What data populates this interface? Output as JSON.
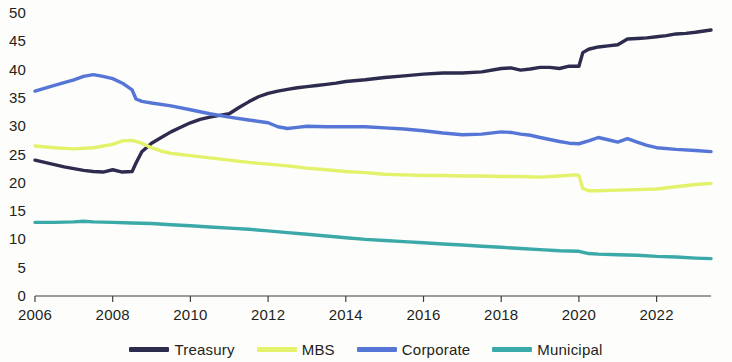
{
  "chart_data": {
    "type": "line",
    "title": "",
    "subtitle": "",
    "xlabel": "",
    "ylabel": "",
    "xlim": [
      2006,
      2023.4
    ],
    "ylim": [
      0,
      50
    ],
    "grid": false,
    "legend_position": "bottom",
    "x_tick_labels": [
      "2006",
      "2008",
      "2010",
      "2012",
      "2014",
      "2016",
      "2018",
      "2020",
      "2022"
    ],
    "x_ticks": [
      2006,
      2008,
      2010,
      2012,
      2014,
      2016,
      2018,
      2020,
      2022
    ],
    "y_tick_labels": [
      "0",
      "5",
      "10",
      "15",
      "20",
      "25",
      "30",
      "35",
      "40",
      "45",
      "50"
    ],
    "y_ticks": [
      0,
      5,
      10,
      15,
      20,
      25,
      30,
      35,
      40,
      45,
      50
    ],
    "series": [
      {
        "name": "Treasury",
        "color": "#2e2c4e",
        "x": [
          2006.0,
          2006.25,
          2006.5,
          2006.75,
          2007.0,
          2007.25,
          2007.5,
          2007.75,
          2008.0,
          2008.25,
          2008.5,
          2008.6,
          2008.75,
          2009.0,
          2009.25,
          2009.5,
          2009.75,
          2010.0,
          2010.25,
          2010.5,
          2010.75,
          2011.0,
          2011.25,
          2011.5,
          2011.75,
          2012.0,
          2012.25,
          2012.5,
          2012.75,
          2013.0,
          2013.25,
          2013.5,
          2013.75,
          2014.0,
          2014.5,
          2015.0,
          2015.5,
          2016.0,
          2016.5,
          2017.0,
          2017.5,
          2018.0,
          2018.25,
          2018.5,
          2018.75,
          2019.0,
          2019.25,
          2019.5,
          2019.75,
          2020.0,
          2020.1,
          2020.25,
          2020.5,
          2020.75,
          2021.0,
          2021.25,
          2021.5,
          2021.75,
          2022.0,
          2022.25,
          2022.5,
          2022.75,
          2023.0,
          2023.4
        ],
        "values": [
          24.0,
          23.6,
          23.2,
          22.8,
          22.5,
          22.2,
          22.0,
          21.9,
          22.3,
          21.9,
          22.0,
          23.5,
          25.5,
          27.0,
          28.0,
          29.0,
          29.8,
          30.6,
          31.2,
          31.6,
          31.9,
          32.2,
          33.3,
          34.3,
          35.2,
          35.8,
          36.2,
          36.5,
          36.8,
          37.0,
          37.2,
          37.4,
          37.6,
          37.9,
          38.2,
          38.6,
          38.9,
          39.2,
          39.4,
          39.4,
          39.6,
          40.2,
          40.3,
          39.9,
          40.1,
          40.4,
          40.4,
          40.2,
          40.6,
          40.6,
          43.0,
          43.6,
          44.0,
          44.2,
          44.4,
          45.4,
          45.5,
          45.6,
          45.8,
          46.0,
          46.3,
          46.4,
          46.6,
          47.0
        ]
      },
      {
        "name": "MBS",
        "color": "#e3f16b",
        "x": [
          2006.0,
          2006.5,
          2007.0,
          2007.5,
          2008.0,
          2008.25,
          2008.5,
          2008.75,
          2009.0,
          2009.25,
          2009.5,
          2009.75,
          2010.0,
          2010.5,
          2011.0,
          2011.5,
          2012.0,
          2012.5,
          2013.0,
          2013.5,
          2014.0,
          2014.5,
          2015.0,
          2015.5,
          2016.0,
          2016.5,
          2017.0,
          2017.5,
          2018.0,
          2018.5,
          2019.0,
          2019.5,
          2019.9,
          2020.0,
          2020.1,
          2020.25,
          2020.5,
          2021.0,
          2021.5,
          2022.0,
          2022.5,
          2023.0,
          2023.4
        ],
        "values": [
          26.5,
          26.2,
          26.0,
          26.2,
          26.8,
          27.4,
          27.5,
          27.0,
          26.2,
          25.6,
          25.2,
          25.0,
          24.8,
          24.4,
          24.0,
          23.6,
          23.3,
          23.0,
          22.6,
          22.3,
          22.0,
          21.8,
          21.5,
          21.4,
          21.3,
          21.3,
          21.2,
          21.2,
          21.1,
          21.1,
          21.0,
          21.2,
          21.4,
          21.3,
          19.0,
          18.6,
          18.6,
          18.7,
          18.8,
          18.9,
          19.3,
          19.7,
          19.9
        ]
      },
      {
        "name": "Corporate",
        "color": "#5576d6",
        "x": [
          2006.0,
          2006.5,
          2007.0,
          2007.25,
          2007.5,
          2007.75,
          2008.0,
          2008.25,
          2008.5,
          2008.6,
          2008.75,
          2009.0,
          2009.5,
          2010.0,
          2010.5,
          2011.0,
          2011.5,
          2012.0,
          2012.25,
          2012.5,
          2012.75,
          2013.0,
          2013.5,
          2014.0,
          2014.5,
          2015.0,
          2015.5,
          2016.0,
          2016.5,
          2017.0,
          2017.5,
          2018.0,
          2018.25,
          2018.5,
          2018.75,
          2019.0,
          2019.5,
          2019.75,
          2020.0,
          2020.25,
          2020.5,
          2020.75,
          2021.0,
          2021.25,
          2021.5,
          2021.75,
          2022.0,
          2022.5,
          2023.0,
          2023.4
        ],
        "values": [
          36.2,
          37.2,
          38.2,
          38.8,
          39.1,
          38.8,
          38.4,
          37.6,
          36.4,
          34.8,
          34.4,
          34.1,
          33.6,
          32.9,
          32.2,
          31.6,
          31.1,
          30.6,
          29.9,
          29.6,
          29.8,
          30.0,
          29.9,
          29.9,
          29.9,
          29.7,
          29.5,
          29.2,
          28.8,
          28.5,
          28.6,
          29.0,
          28.9,
          28.6,
          28.4,
          28.0,
          27.3,
          27.0,
          26.9,
          27.4,
          28.0,
          27.6,
          27.2,
          27.8,
          27.2,
          26.6,
          26.2,
          25.9,
          25.7,
          25.5
        ]
      },
      {
        "name": "Municipal",
        "color": "#3aa9a8",
        "x": [
          2006.0,
          2006.5,
          2007.0,
          2007.25,
          2007.5,
          2008.0,
          2008.5,
          2009.0,
          2009.5,
          2010.0,
          2010.5,
          2011.0,
          2011.5,
          2012.0,
          2012.5,
          2013.0,
          2013.5,
          2014.0,
          2014.5,
          2015.0,
          2015.5,
          2016.0,
          2016.5,
          2017.0,
          2017.5,
          2018.0,
          2018.5,
          2019.0,
          2019.5,
          2020.0,
          2020.25,
          2020.5,
          2021.0,
          2021.5,
          2022.0,
          2022.5,
          2023.0,
          2023.4
        ],
        "values": [
          13.0,
          13.0,
          13.1,
          13.2,
          13.1,
          13.0,
          12.9,
          12.8,
          12.6,
          12.4,
          12.2,
          12.0,
          11.8,
          11.5,
          11.2,
          10.9,
          10.6,
          10.3,
          10.0,
          9.8,
          9.6,
          9.4,
          9.2,
          9.0,
          8.8,
          8.6,
          8.4,
          8.2,
          8.0,
          7.9,
          7.5,
          7.4,
          7.3,
          7.2,
          7.0,
          6.9,
          6.7,
          6.6
        ]
      }
    ]
  },
  "legend": {
    "items": [
      {
        "label": "Treasury",
        "color": "#2e2c4e"
      },
      {
        "label": "MBS",
        "color": "#e3f16b"
      },
      {
        "label": "Corporate",
        "color": "#5576d6"
      },
      {
        "label": "Municipal",
        "color": "#3aa9a8"
      }
    ]
  },
  "axes": {
    "axis_color": "#3f3f3f"
  }
}
